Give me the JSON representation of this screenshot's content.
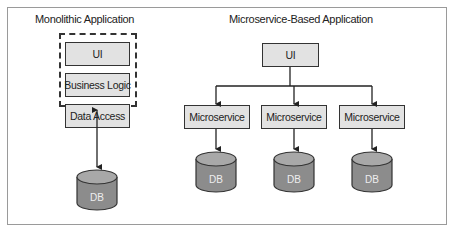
{
  "monolithic": {
    "title": "Monolithic Application",
    "layers": [
      "UI",
      "Business Logic",
      "Data Access"
    ],
    "database": "DB"
  },
  "microservice": {
    "title": "Microservice-Based Application",
    "ui": "UI",
    "services": [
      {
        "label": "Microservice",
        "database": "DB"
      },
      {
        "label": "Microservice",
        "database": "DB"
      },
      {
        "label": "Microservice",
        "database": "DB"
      }
    ]
  },
  "colors": {
    "box_fill": "#e2e2e2",
    "db_fill": "#8c8c8c",
    "db_top": "#a8a8a8",
    "stroke": "#333333"
  }
}
